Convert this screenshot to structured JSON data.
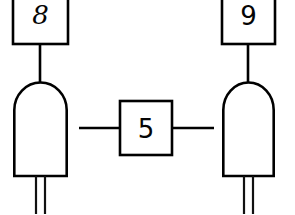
{
  "canvas": {
    "width": 295,
    "height": 214,
    "background": "#ffffff",
    "stroke_color": "#000000",
    "title": "Two-LED schematic with labeled boxes"
  },
  "diagram": {
    "type": "schematic",
    "style": "hand-drawn line art, black on white",
    "nodes": [
      {
        "id": "box-8",
        "kind": "label-box",
        "shape": "rectangle",
        "label": "8",
        "label_style": "script-italic",
        "x": 13,
        "y": -10,
        "width": 55,
        "height": 54
      },
      {
        "id": "led-left",
        "kind": "led",
        "shape": "rounded-top-rectangle",
        "label": "",
        "x": 13,
        "y": 82,
        "width": 55,
        "height": 93,
        "leads": 2
      },
      {
        "id": "box-5",
        "kind": "label-box",
        "shape": "rectangle",
        "label": "5",
        "label_style": "plain",
        "x": 120,
        "y": 101,
        "width": 52,
        "height": 54
      },
      {
        "id": "box-9",
        "kind": "label-box",
        "shape": "rectangle",
        "label": "9",
        "label_style": "plain",
        "x": 222,
        "y": -10,
        "width": 53,
        "height": 54
      },
      {
        "id": "led-right",
        "kind": "led",
        "shape": "rounded-top-rectangle",
        "label": "",
        "x": 222,
        "y": 82,
        "width": 53,
        "height": 93,
        "leads": 2
      }
    ],
    "edges": [
      {
        "id": "wire-8-to-led-left",
        "from": "box-8",
        "to": "led-left",
        "orientation": "vertical",
        "x1": 40,
        "y1": 44,
        "x2": 40,
        "y2": 82
      },
      {
        "id": "wire-9-to-led-right",
        "from": "box-9",
        "to": "led-right",
        "orientation": "vertical",
        "x1": 248,
        "y1": 44,
        "x2": 248,
        "y2": 82
      },
      {
        "id": "wire-led-left-to-5",
        "from": "led-left",
        "to": "box-5",
        "orientation": "horizontal",
        "x1": 79,
        "y1": 128,
        "x2": 120,
        "y2": 128
      },
      {
        "id": "wire-5-to-led-right",
        "from": "box-5",
        "to": "led-right",
        "orientation": "horizontal",
        "x1": 172,
        "y1": 128,
        "x2": 213,
        "y2": 128
      }
    ]
  },
  "labels": {
    "box_8": "8",
    "box_5": "5",
    "box_9": "9"
  }
}
